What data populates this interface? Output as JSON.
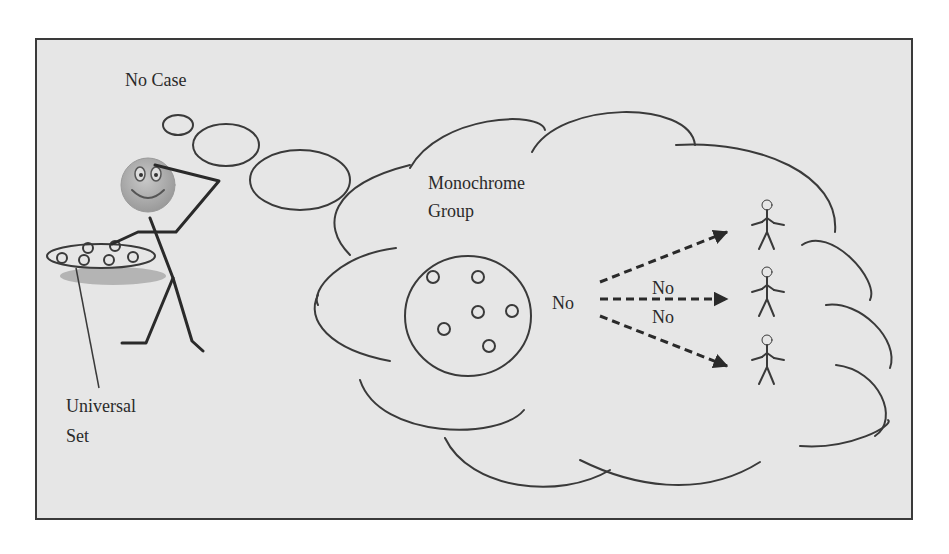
{
  "diagram": {
    "title": "No Case",
    "universal_set_label_line1": "Universal",
    "universal_set_label_line2": "Set",
    "group_label_line1": "Monochrome",
    "group_label_line2": "Group",
    "source_label": "No",
    "arrow_labels": [
      "No",
      "No"
    ],
    "colors": {
      "background": "#e6e6e6",
      "stroke": "#3a3a3a",
      "face": "#b0b0b0",
      "shadow": "#a8a8a8"
    },
    "elements": {
      "thinker": "stick-figure-with-smiley-face",
      "thought_bubbles": 3,
      "cloud": "thought-cloud",
      "group_circle_members": 6,
      "universal_set_members": 7,
      "target_people": 3,
      "arrows": 3
    }
  }
}
